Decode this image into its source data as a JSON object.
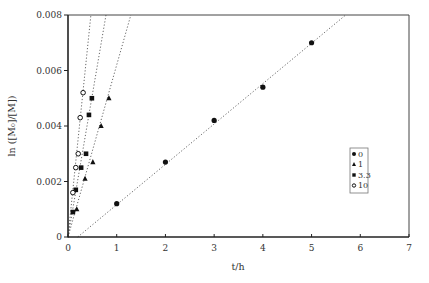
{
  "chart_data": {
    "type": "scatter",
    "title": "",
    "xlabel": "t/h",
    "ylabel": "ln ([M₀]/[M])",
    "xlim": [
      0,
      7
    ],
    "ylim": [
      0,
      0.008
    ],
    "xticks": [
      "0",
      "1",
      "2",
      "3",
      "4",
      "5",
      "6",
      "7"
    ],
    "yticks": [
      "0",
      "0.002",
      "0.004",
      "0.006",
      "0.008"
    ],
    "grid": false,
    "legend_position": "right-middle (inside plot)",
    "series": [
      {
        "name": "0",
        "marker": "filled-circle",
        "points": [
          [
            1.0,
            0.0012
          ],
          [
            2.0,
            0.0027
          ],
          [
            3.0,
            0.0042
          ],
          [
            4.0,
            0.0054
          ],
          [
            5.0,
            0.007
          ]
        ],
        "fit_line": [
          [
            0.2,
            0.0
          ],
          [
            5.7,
            0.008
          ]
        ]
      },
      {
        "name": "1",
        "marker": "filled-triangle",
        "points": [
          [
            0.18,
            0.001
          ],
          [
            0.35,
            0.0021
          ],
          [
            0.51,
            0.0027
          ],
          [
            0.68,
            0.004
          ],
          [
            0.84,
            0.005
          ]
        ],
        "fit_line": [
          [
            0.0,
            0.0
          ],
          [
            1.29,
            0.008
          ]
        ]
      },
      {
        "name": "3.3",
        "marker": "filled-square",
        "points": [
          [
            0.1,
            0.0009
          ],
          [
            0.16,
            0.0017
          ],
          [
            0.27,
            0.0025
          ],
          [
            0.37,
            0.003
          ],
          [
            0.43,
            0.0044
          ],
          [
            0.49,
            0.005
          ]
        ],
        "fit_line": [
          [
            0.0,
            0.0
          ],
          [
            0.78,
            0.008
          ]
        ]
      },
      {
        "name": "10",
        "marker": "open-circle",
        "points": [
          [
            0.1,
            0.0016
          ],
          [
            0.16,
            0.0025
          ],
          [
            0.21,
            0.003
          ],
          [
            0.25,
            0.0043
          ],
          [
            0.31,
            0.0052
          ]
        ],
        "fit_line": [
          [
            0.0,
            0.0
          ],
          [
            0.47,
            0.008
          ]
        ]
      }
    ]
  },
  "legend": {
    "items": [
      {
        "label": "0",
        "marker": "filled-circle"
      },
      {
        "label": "1",
        "marker": "filled-triangle"
      },
      {
        "label": "3.3",
        "marker": "filled-square"
      },
      {
        "label": "10",
        "marker": "open-circle"
      }
    ]
  },
  "colors": {
    "axis": "#222222",
    "marker": "#111111",
    "fit_line": "#666666",
    "text": "#333333",
    "legend_border": "#777777"
  }
}
